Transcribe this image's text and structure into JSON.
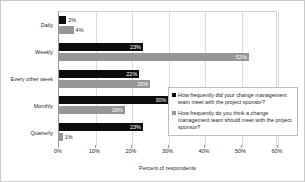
{
  "chart_data": {
    "type": "bar",
    "orientation": "horizontal",
    "title": "",
    "xlabel": "Percent of respondents",
    "ylabel": "",
    "xlim": [
      0,
      60
    ],
    "xticks": [
      "0%",
      "10%",
      "20%",
      "30%",
      "40%",
      "50%",
      "60%"
    ],
    "xtick_values": [
      0,
      10,
      20,
      30,
      40,
      50,
      60
    ],
    "grid": true,
    "legend_position": "middle-right",
    "categories": [
      "Daily",
      "Weekly",
      "Every other week",
      "Monthly",
      "Quarterly"
    ],
    "series": [
      {
        "name": "How frequently did your change management team meet with the project sponsor?",
        "color": "#0d0d0d",
        "values": [
          2,
          23,
          22,
          30,
          23
        ],
        "labels": [
          "2%",
          "23%",
          "22%",
          "30%",
          "23%"
        ]
      },
      {
        "name": "How frequently do you think a change management team should meet with the project sponsor?",
        "color": "#969696",
        "values": [
          4,
          52,
          25,
          18,
          1
        ],
        "labels": [
          "4%",
          "52%",
          "25%",
          "18%",
          "1%"
        ]
      }
    ]
  },
  "legend": {
    "entries": [
      {
        "label": "How frequently did your change management team meet with the project sponsor?",
        "color": "#0d0d0d"
      },
      {
        "label": "How frequently do you think a change management team should meet with the project sponsor?",
        "color": "#969696"
      }
    ]
  }
}
